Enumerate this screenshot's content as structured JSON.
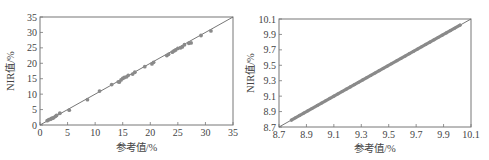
{
  "chart_data": [
    {
      "type": "scatter",
      "title": "",
      "xlabel": "参考值/%",
      "ylabel": "NIR值/%",
      "xlim": [
        0,
        35
      ],
      "ylim": [
        0,
        35
      ],
      "xticks": [
        "0",
        "5",
        "10",
        "15",
        "20",
        "25",
        "30",
        "35"
      ],
      "yticks": [
        "0",
        "5",
        "10",
        "15",
        "20",
        "25",
        "30",
        "35"
      ],
      "grid": false,
      "legend": null,
      "reference_line": {
        "from": [
          0,
          0
        ],
        "to": [
          35,
          35
        ],
        "label": "y = x"
      },
      "series": [
        {
          "name": "samples",
          "x": [
            1.3,
            1.6,
            1.9,
            2.1,
            2.3,
            2.5,
            2.8,
            3.0,
            3.6,
            5.3,
            8.6,
            10.8,
            13.0,
            14.2,
            14.4,
            14.7,
            15.0,
            15.3,
            15.7,
            16.0,
            16.8,
            17.2,
            19.0,
            20.3,
            20.6,
            23.0,
            23.3,
            24.0,
            24.3,
            24.6,
            25.0,
            25.5,
            25.8,
            26.2,
            27.0,
            27.4,
            29.2,
            31.0
          ],
          "y": [
            1.4,
            1.7,
            1.9,
            2.1,
            2.2,
            2.4,
            2.8,
            3.1,
            3.8,
            4.8,
            8.2,
            11.0,
            13.1,
            14.0,
            13.9,
            14.6,
            15.1,
            15.4,
            15.6,
            16.1,
            16.5,
            17.1,
            18.9,
            19.8,
            20.3,
            22.5,
            22.9,
            23.6,
            24.0,
            24.3,
            24.8,
            25.0,
            25.3,
            26.0,
            26.5,
            26.6,
            29.0,
            30.5
          ]
        }
      ],
      "color": "#8a8a8a"
    },
    {
      "type": "scatter",
      "title": "",
      "xlabel": "参考值/%",
      "ylabel": "NIR值/%",
      "xlim": [
        8.7,
        10.1
      ],
      "ylim": [
        8.7,
        10.1
      ],
      "xticks": [
        "8.7",
        "8.9",
        "9.1",
        "9.3",
        "9.5",
        "9.7",
        "9.9",
        "10.1"
      ],
      "yticks": [
        "8.7",
        "8.9",
        "9.1",
        "9.3",
        "9.5",
        "9.7",
        "9.9",
        "10.1"
      ],
      "grid": false,
      "legend": null,
      "reference_line": {
        "from": [
          8.7,
          8.7
        ],
        "to": [
          10.1,
          10.1
        ],
        "label": "y = x"
      },
      "series": [
        {
          "name": "samples",
          "x_range": [
            8.79,
            10.02
          ],
          "x": [
            8.79,
            8.82,
            8.85,
            8.88,
            8.91,
            8.94,
            8.98,
            9.01,
            9.04,
            9.07,
            9.1,
            9.13,
            9.16,
            9.19,
            9.22,
            9.25,
            9.28,
            9.31,
            9.34,
            9.37,
            9.4,
            9.43,
            9.46,
            9.49,
            9.52,
            9.56,
            9.59,
            9.62,
            9.65,
            9.68,
            9.71,
            9.74,
            9.77,
            9.8,
            9.83,
            9.86,
            9.89,
            9.92,
            9.95,
            9.98,
            10.02
          ],
          "y": [
            8.79,
            8.82,
            8.85,
            8.88,
            8.91,
            8.94,
            8.98,
            9.01,
            9.04,
            9.07,
            9.1,
            9.13,
            9.16,
            9.19,
            9.22,
            9.25,
            9.28,
            9.31,
            9.34,
            9.37,
            9.4,
            9.43,
            9.46,
            9.49,
            9.52,
            9.56,
            9.59,
            9.62,
            9.65,
            9.68,
            9.71,
            9.74,
            9.77,
            9.8,
            9.83,
            9.86,
            9.89,
            9.92,
            9.95,
            9.98,
            10.02
          ]
        }
      ],
      "color": "#8a8a8a"
    }
  ]
}
